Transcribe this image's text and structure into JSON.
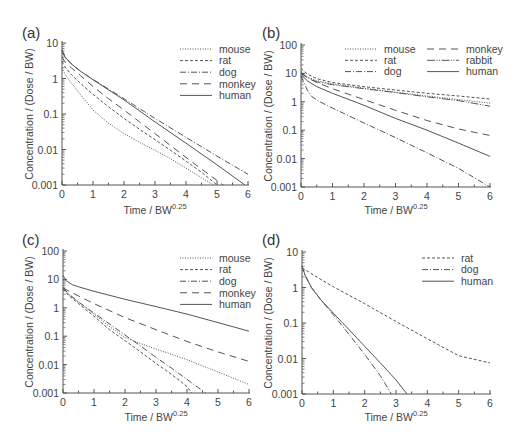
{
  "figure": {
    "x_axis_title": "Time / BW",
    "x_axis_title_sup": "0.25",
    "y_axis_title": "Concentration / (Dose / BW)"
  },
  "line_styles": {
    "mouse": "1,1.5",
    "rat": "3,2",
    "dog": "6,2,1,2",
    "monkey": "7,5",
    "rabbit": "8,1.5,1,1.5,1,1.5",
    "human": ""
  },
  "chart_data": [
    {
      "id": "a",
      "label": "(a)",
      "type": "line",
      "title": "",
      "xlabel": "Time / BW^0.25",
      "ylabel": "Concentration / (Dose / BW)",
      "yscale": "log",
      "xlim": [
        0,
        6
      ],
      "ylim": [
        0.001,
        10
      ],
      "xticks": [
        "0",
        "1",
        "2",
        "3",
        "4",
        "5",
        "6"
      ],
      "yticks": [
        "10",
        "1",
        "0.1",
        "0.01",
        "0.001"
      ],
      "grid": false,
      "legend_position": "upper right",
      "legend": [
        "mouse",
        "rat",
        "dog",
        "monkey",
        "human"
      ],
      "series": [
        {
          "name": "mouse",
          "x": [
            0,
            0.1,
            0.3,
            0.6,
            1.0,
            1.5,
            2.0,
            2.5,
            3.0,
            3.5,
            4.0,
            4.5,
            4.9
          ],
          "y": [
            2.0,
            1.3,
            0.75,
            0.35,
            0.13,
            0.055,
            0.028,
            0.016,
            0.0095,
            0.0055,
            0.003,
            0.0016,
            0.001
          ]
        },
        {
          "name": "rat",
          "x": [
            0,
            0.1,
            0.3,
            0.6,
            1.0,
            1.5,
            2.0,
            2.5,
            3.0,
            3.5,
            4.0,
            4.5,
            5.0
          ],
          "y": [
            3.0,
            2.1,
            1.3,
            0.72,
            0.36,
            0.16,
            0.075,
            0.037,
            0.019,
            0.0095,
            0.0047,
            0.0023,
            0.001
          ]
        },
        {
          "name": "dog",
          "x": [
            0,
            0.1,
            0.3,
            0.6,
            1.0,
            2.0,
            3.0,
            4.0,
            5.0,
            6.0
          ],
          "y": [
            6.0,
            3.8,
            2.6,
            1.6,
            0.95,
            0.27,
            0.075,
            0.022,
            0.0065,
            0.002
          ]
        },
        {
          "name": "monkey",
          "x": [
            0,
            0.1,
            0.3,
            0.6,
            1.0,
            1.5,
            2.0,
            2.5,
            3.0,
            3.5,
            4.0,
            4.5,
            5.2
          ],
          "y": [
            4.0,
            2.9,
            2.0,
            1.2,
            0.6,
            0.27,
            0.13,
            0.06,
            0.028,
            0.013,
            0.006,
            0.0028,
            0.001
          ]
        },
        {
          "name": "human",
          "x": [
            0,
            0.1,
            0.3,
            0.6,
            1.0,
            2.0,
            3.0,
            4.0,
            5.0,
            5.9
          ],
          "y": [
            6.5,
            4.0,
            2.6,
            1.6,
            0.92,
            0.25,
            0.06,
            0.015,
            0.0037,
            0.001
          ]
        }
      ]
    },
    {
      "id": "b",
      "label": "(b)",
      "type": "line",
      "title": "",
      "xlabel": "Time / BW^0.25",
      "ylabel": "Concentration / (Dose / BW)",
      "yscale": "log",
      "xlim": [
        0,
        6
      ],
      "ylim": [
        0.001,
        100
      ],
      "xticks": [
        "0",
        "1",
        "2",
        "3",
        "4",
        "5",
        "6"
      ],
      "yticks": [
        "100",
        "10",
        "1",
        "0.1",
        "0.01",
        "0.001"
      ],
      "grid": false,
      "legend_position": "upper right",
      "legend": [
        "mouse",
        "rat",
        "dog",
        "monkey",
        "rabbit",
        "human"
      ],
      "series": [
        {
          "name": "mouse",
          "x": [
            0,
            0.2,
            0.5,
            1.0,
            2.0,
            3.0,
            4.0,
            5.0,
            6.0
          ],
          "y": [
            12,
            7.5,
            5.5,
            4.3,
            3.0,
            2.2,
            1.6,
            1.2,
            0.9
          ]
        },
        {
          "name": "rat",
          "x": [
            0,
            0.2,
            0.5,
            1.0,
            2.0,
            3.0,
            4.0,
            5.0,
            6.0
          ],
          "y": [
            15,
            9.5,
            6.5,
            4.8,
            3.4,
            2.6,
            2.0,
            1.6,
            1.25
          ]
        },
        {
          "name": "dog",
          "x": [
            0,
            0.1,
            0.2,
            0.35,
            0.6,
            1.0,
            2.0,
            3.0,
            4.0,
            5.0,
            6.0
          ],
          "y": [
            8.0,
            4.5,
            2.6,
            1.5,
            1.0,
            0.6,
            0.18,
            0.055,
            0.016,
            0.0045,
            0.001
          ]
        },
        {
          "name": "monkey",
          "x": [
            0,
            0.2,
            0.5,
            1.0,
            2.0,
            3.0,
            4.0,
            5.0,
            6.0
          ],
          "y": [
            10,
            7.0,
            4.8,
            2.9,
            1.2,
            0.5,
            0.22,
            0.11,
            0.065
          ]
        },
        {
          "name": "rabbit",
          "x": [
            0,
            0.2,
            0.5,
            1.0,
            2.0,
            3.0,
            4.0,
            5.0,
            6.0
          ],
          "y": [
            11,
            7.0,
            5.0,
            4.0,
            2.9,
            2.1,
            1.5,
            1.1,
            0.7
          ]
        },
        {
          "name": "human",
          "x": [
            0,
            0.2,
            0.5,
            1.0,
            2.0,
            3.0,
            4.0,
            5.0,
            6.0
          ],
          "y": [
            9,
            5.5,
            3.4,
            2.0,
            0.75,
            0.26,
            0.1,
            0.035,
            0.012
          ]
        }
      ]
    },
    {
      "id": "c",
      "label": "(c)",
      "type": "line",
      "title": "",
      "xlabel": "Time / BW^0.25",
      "ylabel": "Concentration / (Dose / BW)",
      "yscale": "log",
      "xlim": [
        0,
        6
      ],
      "ylim": [
        0.001,
        100
      ],
      "xticks": [
        "0",
        "1",
        "2",
        "3",
        "4",
        "5",
        "6"
      ],
      "yticks": [
        "100",
        "10",
        "1",
        "0.1",
        "0.01",
        "0.001"
      ],
      "grid": false,
      "legend_position": "upper right",
      "legend": [
        "mouse",
        "rat",
        "dog",
        "monkey",
        "human"
      ],
      "series": [
        {
          "name": "mouse",
          "x": [
            0,
            0.2,
            0.5,
            1.0,
            1.5,
            2.0,
            2.5,
            3.0,
            4.0,
            5.0,
            6.0
          ],
          "y": [
            5,
            2.8,
            1.6,
            0.6,
            0.22,
            0.09,
            0.055,
            0.035,
            0.015,
            0.0055,
            0.002
          ]
        },
        {
          "name": "rat",
          "x": [
            0,
            0.2,
            0.5,
            1.0,
            1.5,
            2.0,
            2.5,
            3.0,
            3.5,
            4.0,
            4.15
          ],
          "y": [
            4.5,
            2.6,
            1.4,
            0.5,
            0.17,
            0.07,
            0.028,
            0.011,
            0.0045,
            0.0017,
            0.001
          ]
        },
        {
          "name": "dog",
          "x": [
            0,
            0.2,
            0.5,
            1.0,
            1.5,
            2.0,
            2.5,
            3.0,
            3.5,
            4.0,
            4.6
          ],
          "y": [
            5,
            3.0,
            1.6,
            0.65,
            0.27,
            0.11,
            0.045,
            0.018,
            0.0075,
            0.003,
            0.001
          ]
        },
        {
          "name": "monkey",
          "x": [
            0,
            0.2,
            0.5,
            1.0,
            2.0,
            3.0,
            4.0,
            5.0,
            6.0
          ],
          "y": [
            5,
            3.8,
            2.6,
            1.4,
            0.45,
            0.17,
            0.065,
            0.028,
            0.013
          ]
        },
        {
          "name": "human",
          "x": [
            0,
            0.1,
            0.3,
            0.5,
            1.0,
            2.0,
            3.0,
            4.0,
            5.0,
            6.0
          ],
          "y": [
            14,
            9,
            6.5,
            5.5,
            3.8,
            2.0,
            1.1,
            0.6,
            0.3,
            0.15
          ]
        }
      ]
    },
    {
      "id": "d",
      "label": "(d)",
      "type": "line",
      "title": "",
      "xlabel": "Time / BW^0.25",
      "ylabel": "Concentration / (Dose / BW)",
      "yscale": "log",
      "xlim": [
        0,
        6
      ],
      "ylim": [
        0.001,
        10
      ],
      "xticks": [
        "0",
        "1",
        "2",
        "3",
        "4",
        "5",
        "6"
      ],
      "yticks": [
        "10",
        "1",
        "0.1",
        "0.01",
        "0.001"
      ],
      "grid": false,
      "legend_position": "upper right",
      "legend": [
        "rat",
        "dog",
        "human"
      ],
      "series": [
        {
          "name": "rat",
          "x": [
            0,
            0.2,
            0.5,
            1.0,
            2.0,
            3.0,
            4.0,
            5.0,
            6.0
          ],
          "y": [
            3.5,
            2.8,
            1.9,
            1.05,
            0.35,
            0.11,
            0.036,
            0.012,
            0.0075
          ]
        },
        {
          "name": "dog",
          "x": [
            0,
            0.1,
            0.3,
            0.6,
            1.0,
            1.5,
            2.0,
            2.5,
            2.85
          ],
          "y": [
            4.0,
            2.2,
            1.0,
            0.45,
            0.17,
            0.048,
            0.013,
            0.0033,
            0.001
          ]
        },
        {
          "name": "human",
          "x": [
            0,
            0.1,
            0.3,
            0.6,
            1.0,
            1.5,
            2.0,
            2.5,
            3.0,
            3.35
          ],
          "y": [
            4.0,
            2.2,
            1.0,
            0.45,
            0.19,
            0.065,
            0.022,
            0.0075,
            0.0025,
            0.001
          ]
        }
      ]
    }
  ]
}
